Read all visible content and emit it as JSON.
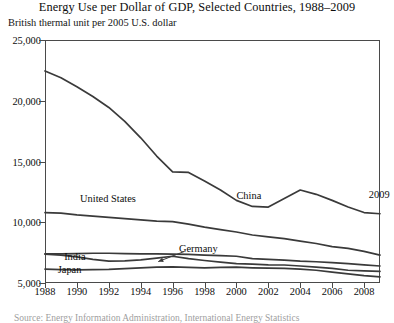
{
  "chart_data": {
    "type": "line",
    "title": "Energy Use per Dollar of GDP, Selected Countries, 1988–2009",
    "subtitle": "British thermal unit per 2005 U.S. dollar",
    "ylabel": "British thermal unit per 2005 U.S. dollar",
    "xlabel": "",
    "ylim": [
      5000,
      25000
    ],
    "xlim": [
      1988,
      2009
    ],
    "grid": false,
    "legend_position": "inline-annotations",
    "y_ticks": [
      25000,
      20000,
      15000,
      10000,
      5000
    ],
    "y_tick_labels": [
      "25,000",
      "20,000",
      "15,000",
      "10,000",
      "5,000"
    ],
    "x_ticks": [
      1988,
      1990,
      1992,
      1994,
      1996,
      1998,
      2000,
      2002,
      2004,
      2006,
      2008
    ],
    "x_tick_labels": [
      "1988",
      "1990",
      "1992",
      "1994",
      "1996",
      "1998",
      "2000",
      "2002",
      "2004",
      "2006",
      "2008"
    ],
    "x": [
      1988,
      1989,
      1990,
      1991,
      1992,
      1993,
      1994,
      1995,
      1996,
      1997,
      1998,
      1999,
      2000,
      2001,
      2002,
      2003,
      2004,
      2005,
      2006,
      2007,
      2008,
      2009
    ],
    "series": [
      {
        "name": "China",
        "values": [
          22450,
          21900,
          21150,
          20350,
          19450,
          18300,
          16950,
          15450,
          14150,
          14100,
          13400,
          12650,
          11800,
          11300,
          11250,
          11950,
          12650,
          12300,
          11800,
          11250,
          10800,
          10700
        ]
      },
      {
        "name": "United States",
        "values": [
          10800,
          10750,
          10600,
          10500,
          10400,
          10300,
          10200,
          10100,
          10050,
          9850,
          9600,
          9400,
          9200,
          8950,
          8800,
          8650,
          8450,
          8250,
          8000,
          7850,
          7600,
          7300
        ]
      },
      {
        "name": "India",
        "values": [
          7400,
          7400,
          7420,
          7450,
          7450,
          7420,
          7400,
          7400,
          7380,
          7350,
          7300,
          7250,
          7200,
          7000,
          6950,
          6880,
          6800,
          6750,
          6680,
          6600,
          6500,
          6400
        ]
      },
      {
        "name": "Germany",
        "values": [
          7380,
          7300,
          7150,
          6950,
          6800,
          6820,
          6900,
          7050,
          7200,
          7000,
          6850,
          6720,
          6600,
          6550,
          6500,
          6480,
          6400,
          6300,
          6200,
          6050,
          6000,
          5950
        ]
      },
      {
        "name": "Japan",
        "values": [
          6150,
          6100,
          6080,
          6100,
          6120,
          6180,
          6250,
          6300,
          6320,
          6280,
          6250,
          6280,
          6300,
          6250,
          6220,
          6200,
          6150,
          6050,
          5900,
          5750,
          5600,
          5500
        ]
      }
    ],
    "annotations": [
      {
        "text": "China",
        "x": 2000,
        "y": 12100,
        "series": "China"
      },
      {
        "text": "2009",
        "x": 2008.3,
        "y": 12200,
        "series": "China"
      },
      {
        "text": "United States",
        "x": 1990.2,
        "y": 11800,
        "series": "United States"
      },
      {
        "text": "India",
        "x": 1989.2,
        "y": 7050,
        "series": "India"
      },
      {
        "text": "Germany",
        "x": 1996.4,
        "y": 7750,
        "series": "Germany",
        "has_arrow": true
      },
      {
        "text": "Japan",
        "x": 1988.8,
        "y": 6000,
        "series": "Japan"
      }
    ]
  },
  "source_note": "Source: Energy Information Administration, International Energy Statistics",
  "colors": {
    "line": "#3a3a3a",
    "axis": "#4a4a4a",
    "text": "#0d0d0d",
    "background": "#ffffff"
  }
}
